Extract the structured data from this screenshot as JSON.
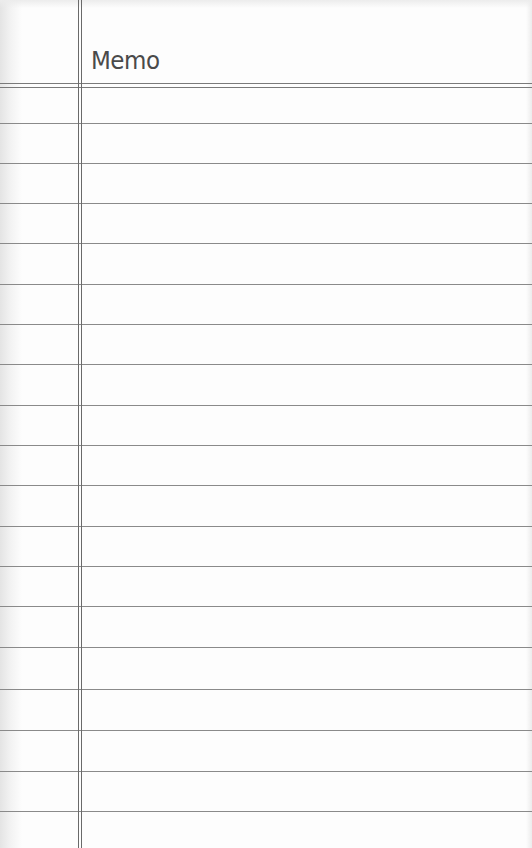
{
  "page": {
    "title": "Memo",
    "style": "lined-notepad",
    "colors": {
      "paper": "#fdfdfd",
      "rule_line": "#8a8a8a",
      "margin_line": "#6a6a6a",
      "title_text": "#4a4a4a"
    },
    "ruled_line_count": 18
  }
}
